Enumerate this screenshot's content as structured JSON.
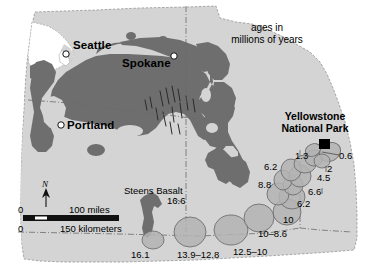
{
  "figure": {
    "type": "geologic-map",
    "region": "Pacific Northwest / Columbia River Basalt and Yellowstone hotspot track",
    "legend_note_line1": "ages in",
    "legend_note_line2": "millions of years"
  },
  "cities": [
    {
      "name": "Seattle",
      "x": 78,
      "y": 46
    },
    {
      "name": "Spokane",
      "x": 126,
      "y": 63
    },
    {
      "name": "Portland",
      "x": 66,
      "y": 123
    }
  ],
  "park": {
    "line1": "Yellowstone",
    "line2": "National Park",
    "marker_x": 324,
    "marker_y": 144
  },
  "steens": {
    "label": "Steens Basalt",
    "age": "16.6"
  },
  "hotspot_track": {
    "ages": [
      {
        "label": "16.1",
        "x": 141,
        "y": 255
      },
      {
        "label": "13.9–12.8",
        "x": 181,
        "y": 255
      },
      {
        "label": "12.5–10",
        "x": 236,
        "y": 252
      },
      {
        "label": "10–8.6",
        "x": 262,
        "y": 234
      },
      {
        "label": "10",
        "x": 289,
        "y": 219
      },
      {
        "label": "6.2",
        "x": 302,
        "y": 203
      },
      {
        "label": "8.8",
        "x": 266,
        "y": 184
      },
      {
        "label": "6.6",
        "x": 313,
        "y": 191
      },
      {
        "label": "6.2",
        "x": 271,
        "y": 166
      },
      {
        "label": "4.5",
        "x": 322,
        "y": 177
      },
      {
        "label": "2",
        "x": 329,
        "y": 169
      },
      {
        "label": "1.3",
        "x": 301,
        "y": 155
      },
      {
        "label": "0.6",
        "x": 344,
        "y": 155
      }
    ]
  },
  "scale_bar": {
    "zero_top": "0",
    "zero_bottom": "0",
    "miles_label": "100 miles",
    "km_label": "150 kilometers"
  },
  "compass": {
    "letter": "N"
  },
  "colors": {
    "land": "#d4d4d4",
    "basalt": "#6e6e6e",
    "caldera": "#b3b3b3",
    "outline": "#555555",
    "marker": "#000000",
    "page": "#ffffff"
  }
}
